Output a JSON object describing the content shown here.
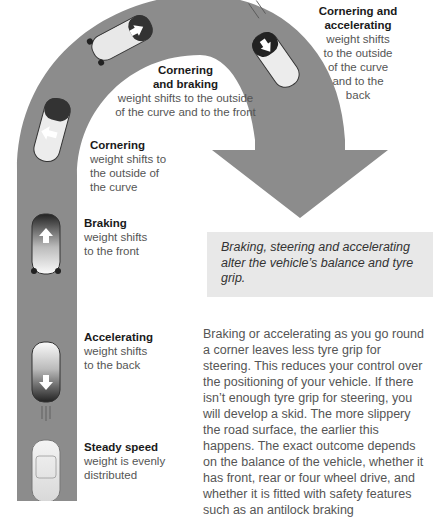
{
  "diagram": {
    "road_color": "#8c8c8c",
    "labels": [
      {
        "id": "cornering-accelerating",
        "title": "Cornering and accelerating",
        "title_lines": [
          "Cornering and",
          "accelerating"
        ],
        "desc_lines": [
          "weight shifts",
          "to the outside",
          "of the curve",
          "and to the",
          "back"
        ]
      },
      {
        "id": "cornering-braking",
        "title_lines": [
          "Cornering",
          "and braking"
        ],
        "desc_lines": [
          "weight shifts to the outside",
          "of the curve and to the front"
        ]
      },
      {
        "id": "cornering",
        "title_lines": [
          "Cornering"
        ],
        "desc_lines": [
          "weight shifts to",
          "the outside of",
          "the curve"
        ]
      },
      {
        "id": "braking",
        "title_lines": [
          "Braking"
        ],
        "desc_lines": [
          "weight shifts",
          "to the front"
        ]
      },
      {
        "id": "accelerating",
        "title_lines": [
          "Accelerating"
        ],
        "desc_lines": [
          "weight shifts",
          "to the back"
        ]
      },
      {
        "id": "steady-speed",
        "title_lines": [
          "Steady speed"
        ],
        "desc_lines": [
          "weight is evenly",
          "distributed"
        ]
      }
    ]
  },
  "callout": {
    "text": "Braking, steering and accelerating alter the vehicle’s balance and tyre grip."
  },
  "body": {
    "paragraph": "Braking or accelerating as you go round a corner leaves less tyre grip for steering. This reduces your control over the positioning of your vehicle. If there isn’t enough tyre grip for steering, you will develop a skid. The more slippery the road surface, the earlier this happens. The exact outcome depends on the balance of the vehicle, whether it has front, rear or four wheel drive, and whether it is fitted with safety features such as an antilock braking"
  }
}
